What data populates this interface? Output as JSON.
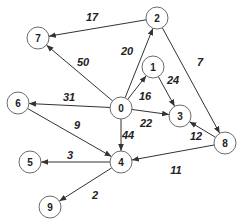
{
  "diagram": {
    "type": "directed-weighted-graph",
    "nodes": [
      {
        "id": "0",
        "label": "0"
      },
      {
        "id": "1",
        "label": "1"
      },
      {
        "id": "2",
        "label": "2"
      },
      {
        "id": "3",
        "label": "3"
      },
      {
        "id": "4",
        "label": "4"
      },
      {
        "id": "5",
        "label": "5"
      },
      {
        "id": "6",
        "label": "6"
      },
      {
        "id": "7",
        "label": "7"
      },
      {
        "id": "8",
        "label": "8"
      },
      {
        "id": "9",
        "label": "9"
      }
    ],
    "edges": [
      {
        "from": "2",
        "to": "7",
        "weight": "17"
      },
      {
        "from": "0",
        "to": "7",
        "weight": "50"
      },
      {
        "from": "0",
        "to": "2",
        "weight": "20"
      },
      {
        "from": "2",
        "to": "8",
        "weight": "7"
      },
      {
        "from": "0",
        "to": "1",
        "weight": "16"
      },
      {
        "from": "1",
        "to": "3",
        "weight": "24"
      },
      {
        "from": "0",
        "to": "6",
        "weight": "31"
      },
      {
        "from": "0",
        "to": "3",
        "weight": "22"
      },
      {
        "from": "6",
        "to": "4",
        "weight": "9"
      },
      {
        "from": "0",
        "to": "4",
        "weight": "44"
      },
      {
        "from": "8",
        "to": "3",
        "weight": "12"
      },
      {
        "from": "8",
        "to": "4",
        "weight": "11"
      },
      {
        "from": "4",
        "to": "5",
        "weight": "3"
      },
      {
        "from": "4",
        "to": "9",
        "weight": "2"
      }
    ]
  }
}
